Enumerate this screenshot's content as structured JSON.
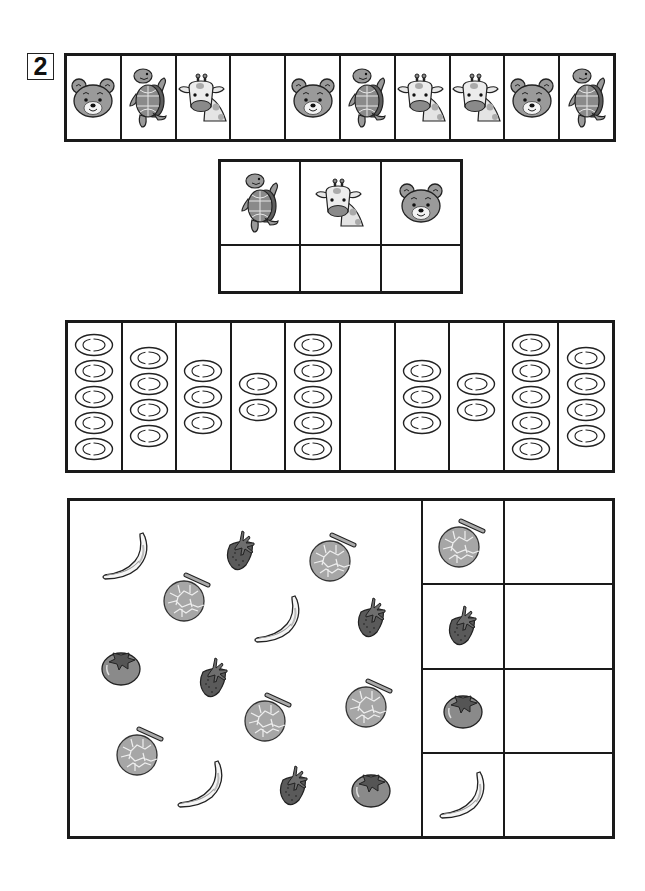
{
  "question_number": "2",
  "animal_sequence": {
    "cells": [
      "bear",
      "turtle",
      "giraffe",
      "",
      "bear",
      "turtle",
      "giraffe",
      "giraffe",
      "bear",
      "turtle"
    ]
  },
  "animal_tally": {
    "headers": [
      "turtle",
      "giraffe",
      "bear"
    ],
    "answers": [
      "",
      "",
      ""
    ]
  },
  "plate_columns": {
    "counts": [
      5,
      4,
      3,
      2,
      5,
      0,
      3,
      2,
      5,
      4
    ]
  },
  "fruit_scatter": {
    "items": [
      {
        "type": "banana",
        "x": 30,
        "y": 30
      },
      {
        "type": "strawberry",
        "x": 152,
        "y": 28
      },
      {
        "type": "melon",
        "x": 238,
        "y": 28
      },
      {
        "type": "melon",
        "x": 92,
        "y": 68
      },
      {
        "type": "banana",
        "x": 182,
        "y": 93
      },
      {
        "type": "strawberry",
        "x": 283,
        "y": 95
      },
      {
        "type": "persimmon",
        "x": 30,
        "y": 148
      },
      {
        "type": "strawberry",
        "x": 125,
        "y": 155
      },
      {
        "type": "melon",
        "x": 173,
        "y": 188
      },
      {
        "type": "melon",
        "x": 274,
        "y": 174
      },
      {
        "type": "melon",
        "x": 45,
        "y": 222
      },
      {
        "type": "banana",
        "x": 105,
        "y": 258
      },
      {
        "type": "strawberry",
        "x": 205,
        "y": 263
      },
      {
        "type": "persimmon",
        "x": 280,
        "y": 270
      }
    ]
  },
  "fruit_tally": {
    "rows": [
      {
        "fruit": "melon",
        "answer": ""
      },
      {
        "fruit": "strawberry",
        "answer": ""
      },
      {
        "fruit": "persimmon",
        "answer": ""
      },
      {
        "fruit": "banana",
        "answer": ""
      }
    ]
  },
  "colors": {
    "line": "#1a1a1a",
    "fill_mid": "#9a9a9a",
    "fill_dark": "#5e5e5e",
    "fill_light": "#d0d0d0"
  }
}
